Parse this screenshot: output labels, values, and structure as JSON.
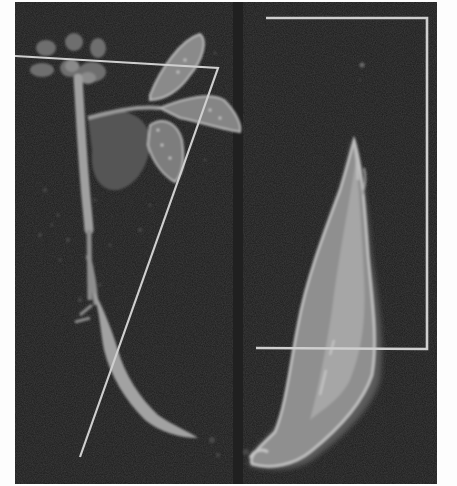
{
  "image": {
    "description": "Grayscale micrograph-style image on black background showing a seedling with leaves and a stem (left) and an elongated root/tuber structure (right), each with light gray measurement overlay lines",
    "background_color": "#1c1c1c",
    "page_color": "#fdfdfd",
    "overlay_color": "#cfcfcf",
    "panel": {
      "x": 15,
      "y": 2,
      "width": 422,
      "height": 482
    }
  },
  "left_specimen": {
    "label": "seedling",
    "overlay": {
      "type": "polyline",
      "points": [
        [
          15,
          56
        ],
        [
          218,
          68
        ],
        [
          80,
          457
        ]
      ]
    }
  },
  "right_specimen": {
    "label": "root",
    "overlay": {
      "type": "polyline",
      "points": [
        [
          266,
          18
        ],
        [
          427,
          18
        ],
        [
          427,
          349
        ],
        [
          256,
          348
        ]
      ]
    }
  }
}
